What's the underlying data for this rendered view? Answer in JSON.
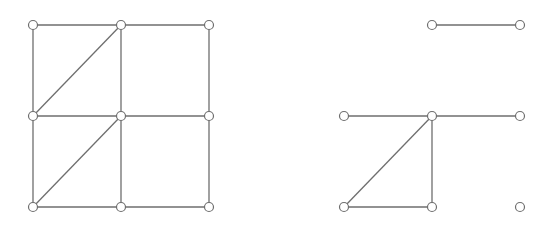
{
  "diagram": {
    "type": "graph-pair",
    "colors": {
      "edge": "#6e6e6e",
      "node_stroke": "#6e6e6e",
      "node_fill": "#ffffff",
      "background": "#ffffff"
    },
    "node_radius": 4.5,
    "graphs": [
      {
        "name": "grid-graph",
        "nodes": [
          {
            "id": "a",
            "x": 33,
            "y": 25
          },
          {
            "id": "b",
            "x": 121,
            "y": 25
          },
          {
            "id": "c",
            "x": 209,
            "y": 25
          },
          {
            "id": "d",
            "x": 33,
            "y": 116
          },
          {
            "id": "e",
            "x": 121,
            "y": 116
          },
          {
            "id": "f",
            "x": 209,
            "y": 116
          },
          {
            "id": "g",
            "x": 33,
            "y": 207
          },
          {
            "id": "h",
            "x": 121,
            "y": 207
          },
          {
            "id": "i",
            "x": 209,
            "y": 207
          }
        ],
        "edges": [
          [
            "a",
            "b"
          ],
          [
            "b",
            "c"
          ],
          [
            "d",
            "e"
          ],
          [
            "e",
            "f"
          ],
          [
            "g",
            "h"
          ],
          [
            "h",
            "i"
          ],
          [
            "a",
            "d"
          ],
          [
            "d",
            "g"
          ],
          [
            "b",
            "e"
          ],
          [
            "e",
            "h"
          ],
          [
            "c",
            "f"
          ],
          [
            "f",
            "i"
          ],
          [
            "d",
            "b"
          ],
          [
            "g",
            "e"
          ]
        ]
      },
      {
        "name": "subgraph",
        "nodes": [
          {
            "id": "b",
            "x": 432,
            "y": 25
          },
          {
            "id": "c",
            "x": 520,
            "y": 25
          },
          {
            "id": "d",
            "x": 344,
            "y": 116
          },
          {
            "id": "e",
            "x": 432,
            "y": 116
          },
          {
            "id": "f",
            "x": 520,
            "y": 116
          },
          {
            "id": "g",
            "x": 344,
            "y": 207
          },
          {
            "id": "h",
            "x": 432,
            "y": 207
          },
          {
            "id": "i",
            "x": 520,
            "y": 207
          }
        ],
        "edges": [
          [
            "b",
            "c"
          ],
          [
            "d",
            "e"
          ],
          [
            "e",
            "f"
          ],
          [
            "e",
            "h"
          ],
          [
            "g",
            "h"
          ],
          [
            "g",
            "e"
          ]
        ]
      }
    ]
  }
}
